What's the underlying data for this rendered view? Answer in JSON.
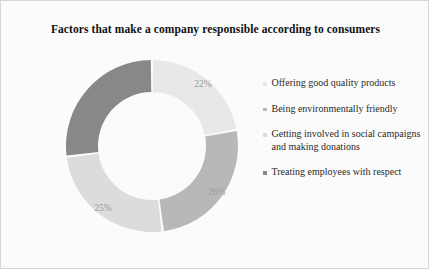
{
  "chart_data": {
    "type": "pie",
    "variant": "donut",
    "title": "Factors that make a company responsible according to consumers",
    "xlabel": "",
    "ylabel": "",
    "grid": false,
    "legend_position": "right",
    "start_angle_oclock": 12,
    "direction": "clockwise",
    "categories": [
      "Offering good quality products",
      "Being environmentally friendly",
      "Getting involved in social campaigns and making donations",
      "Treating employees with respect"
    ],
    "values": [
      22,
      26,
      25,
      27
    ],
    "value_labels": [
      "22%",
      "26%",
      "25%",
      ""
    ],
    "colors": [
      "#e8e8e8",
      "#b8b8b8",
      "#dcdcdc",
      "#888888"
    ],
    "slices": [
      {
        "label": "Offering good quality products",
        "value": 22,
        "display": "22%",
        "color": "#e8e8e8",
        "position": "top-right"
      },
      {
        "label": "Being environmentally friendly",
        "value": 26,
        "display": "26%",
        "color": "#b8b8b8",
        "position": "bottom-right"
      },
      {
        "label": "Getting involved in social campaigns and making donations",
        "value": 25,
        "display": "25%",
        "color": "#dcdcdc",
        "position": "bottom-left"
      },
      {
        "label": "Treating employees with respect",
        "value": 27,
        "display": "",
        "color": "#888888",
        "position": "left"
      }
    ]
  },
  "legend": {
    "items": [
      {
        "label": "Offering good quality products",
        "color": "#e8e8e8"
      },
      {
        "label": "Being environmentally friendly",
        "color": "#b8b8b8"
      },
      {
        "label": "Getting involved in social campaigns and making donations",
        "color": "#dcdcdc"
      },
      {
        "label": "Treating employees with respect",
        "color": "#888888"
      }
    ]
  },
  "style": {
    "background": "#fbfbfb",
    "border": "#d6d6d6",
    "title_color": "#111111",
    "label_color": "#9b9b9b",
    "legend_text_color": "#2a2a2a",
    "gap_color": "#fbfbfb"
  }
}
